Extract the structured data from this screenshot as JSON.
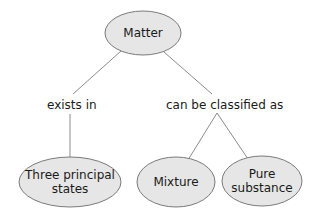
{
  "diagram": {
    "type": "concept-map",
    "colors": {
      "node_fill": "#e6e6e6",
      "node_stroke": "#7a7a7a",
      "edge": "#8c8c8c",
      "text": "#1a1a1a"
    },
    "nodes": {
      "root": {
        "label": "Matter"
      },
      "states": {
        "line1": "Three principal",
        "line2": "states"
      },
      "mixture": {
        "label": "Mixture"
      },
      "pure": {
        "line1": "Pure",
        "line2": "substance"
      }
    },
    "edges": {
      "left_link": "exists in",
      "right_link": "can be classified as"
    }
  }
}
